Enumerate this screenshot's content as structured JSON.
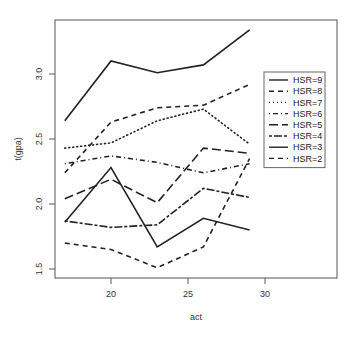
{
  "chart_data": {
    "type": "line",
    "title": "",
    "xlabel": "act",
    "ylabel": "t(gpa)",
    "xlim": [
      16.4,
      33.2
    ],
    "ylim": [
      1.44,
      3.44
    ],
    "x_ticks": [
      20,
      25,
      30
    ],
    "y_ticks": [
      1.5,
      2.0,
      2.5,
      3.0
    ],
    "y_tick_labels": [
      "1.5",
      "2.0",
      "2.5",
      "3.0"
    ],
    "x_tick_labels": [
      "20",
      "25",
      "30"
    ],
    "grid": false,
    "legend_position": "right",
    "x": [
      17,
      20,
      23,
      26,
      29
    ],
    "series": [
      {
        "name": "HSR=9",
        "style": "solid",
        "values": [
          2.64,
          3.1,
          3.01,
          3.07,
          3.34
        ]
      },
      {
        "name": "HSR=8",
        "style": "dashed",
        "values": [
          2.24,
          2.63,
          2.74,
          2.76,
          2.92
        ]
      },
      {
        "name": "HSR=7",
        "style": "dotted",
        "values": [
          2.43,
          2.47,
          2.64,
          2.73,
          2.46
        ]
      },
      {
        "name": "HSR=6",
        "style": "dotdash",
        "values": [
          2.31,
          2.37,
          2.32,
          2.24,
          2.31
        ]
      },
      {
        "name": "HSR=5",
        "style": "longdash",
        "values": [
          2.04,
          2.19,
          2.01,
          2.43,
          2.39
        ]
      },
      {
        "name": "HSR=4",
        "style": "twodash",
        "values": [
          1.87,
          1.82,
          1.84,
          2.12,
          2.05
        ]
      },
      {
        "name": "HSR=3",
        "style": "solid",
        "values": [
          1.86,
          2.28,
          1.67,
          1.89,
          1.8
        ]
      },
      {
        "name": "HSR=2",
        "style": "dashed",
        "values": [
          1.7,
          1.65,
          1.51,
          1.67,
          2.35
        ]
      }
    ],
    "line_color": "#222222",
    "axis_color": "#555555"
  }
}
